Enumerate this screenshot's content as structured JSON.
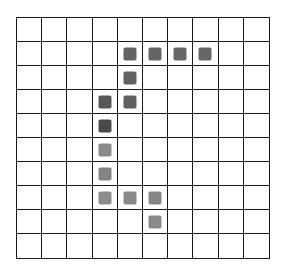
{
  "board": {
    "cols": 10,
    "rows": 10,
    "line_color": "#1a1a1a",
    "background": "#ffffff"
  },
  "tiles": [
    {
      "col": 4,
      "row": 1,
      "color": "#636363"
    },
    {
      "col": 5,
      "row": 1,
      "color": "#656565"
    },
    {
      "col": 6,
      "row": 1,
      "color": "#676767"
    },
    {
      "col": 7,
      "row": 1,
      "color": "#676767"
    },
    {
      "col": 4,
      "row": 2,
      "color": "#626262"
    },
    {
      "col": 3,
      "row": 3,
      "color": "#565656"
    },
    {
      "col": 4,
      "row": 3,
      "color": "#606060"
    },
    {
      "col": 3,
      "row": 4,
      "color": "#4a4a4a"
    },
    {
      "col": 3,
      "row": 5,
      "color": "#8a8a8a"
    },
    {
      "col": 3,
      "row": 6,
      "color": "#848484"
    },
    {
      "col": 3,
      "row": 7,
      "color": "#8c8c8c"
    },
    {
      "col": 4,
      "row": 7,
      "color": "#8a8a8a"
    },
    {
      "col": 5,
      "row": 7,
      "color": "#858585"
    },
    {
      "col": 5,
      "row": 8,
      "color": "#8a8a8a"
    }
  ]
}
